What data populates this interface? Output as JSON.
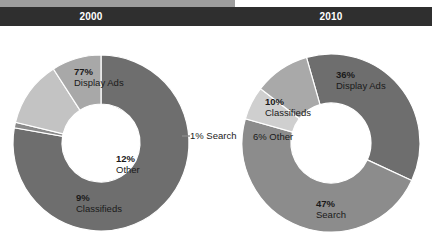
{
  "header": {
    "left_year": "2000",
    "right_year": "2010",
    "bar_color": "#2f2f2f",
    "strip_color": "#9d9d9d",
    "text_color": "#ffffff"
  },
  "palette": {
    "display_ads": "#6e6e6e",
    "search_left": "#8a8a8a",
    "other_left": "#c3c3c3",
    "classifieds_left": "#a8a8a8",
    "search_right": "#8c8c8c",
    "other_right": "#cfcfcf",
    "classifieds_right": "#a9a9a9",
    "hole": "#ffffff",
    "label_text": "#1a1a1a"
  },
  "chart_data": [
    {
      "type": "pie",
      "title": "2000",
      "hole": 0.44,
      "legend": "none",
      "labels": [
        "Display Ads",
        "Search",
        "Other",
        "Classifieds"
      ],
      "values": [
        77,
        1,
        12,
        9
      ],
      "value_labels": [
        "77%",
        "1%",
        "12%",
        "9%"
      ],
      "colors": [
        "#6e6e6e",
        "#8a8a8a",
        "#c3c3c3",
        "#a8a8a8"
      ],
      "annotations": [
        {
          "pct": "77%",
          "name": "Display Ads",
          "placement": "inside"
        },
        {
          "pct": "1%",
          "name": "Search",
          "placement": "outside-right"
        },
        {
          "pct": "12%",
          "name": "Other",
          "placement": "inside"
        },
        {
          "pct": "9%",
          "name": "Classifieds",
          "placement": "inside"
        }
      ]
    },
    {
      "type": "pie",
      "title": "2010",
      "hole": 0.45,
      "legend": "none",
      "labels": [
        "Display Ads",
        "Search",
        "Other",
        "Classifieds"
      ],
      "values": [
        36,
        47,
        6,
        10
      ],
      "value_labels": [
        "36%",
        "47%",
        "6%",
        "10%"
      ],
      "colors": [
        "#6e6e6e",
        "#8c8c8c",
        "#cfcfcf",
        "#a9a9a9"
      ],
      "annotations": [
        {
          "pct": "36%",
          "name": "Display Ads",
          "placement": "inside"
        },
        {
          "pct": "47%",
          "name": "Search",
          "placement": "inside"
        },
        {
          "pct": "6%",
          "name": "Other",
          "placement": "inside"
        },
        {
          "pct": "10%",
          "name": "Classifieds",
          "placement": "inside"
        }
      ]
    }
  ],
  "left_chart": {
    "display_ads_pct": "77%",
    "display_ads_name": "Display Ads",
    "search_label": "1% Search",
    "other_pct": "12%",
    "other_name": "Other",
    "classifieds_pct": "9%",
    "classifieds_name": "Classifieds"
  },
  "right_chart": {
    "display_ads_pct": "36%",
    "display_ads_name": "Display Ads",
    "classifieds_pct": "10%",
    "classifieds_name": "Classifieds",
    "other_label": "6% Other",
    "search_pct": "47%",
    "search_name": "Search"
  }
}
